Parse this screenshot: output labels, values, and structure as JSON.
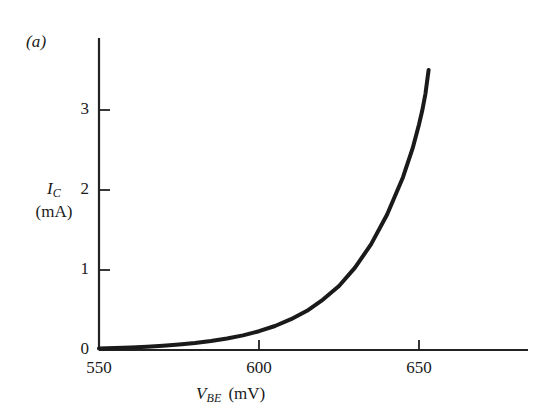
{
  "figure": {
    "panel_label": "(a)",
    "background_color": "#ffffff",
    "curve_color": "#1a1a1a",
    "axis_color": "#222222"
  },
  "axes": {
    "y": {
      "symbol": "I",
      "subscript": "C",
      "unit": "(mA)",
      "ticks": [
        {
          "value": 0,
          "label": "0"
        },
        {
          "value": 1,
          "label": "1"
        },
        {
          "value": 2,
          "label": "2"
        },
        {
          "value": 3,
          "label": "3"
        }
      ],
      "range": [
        0,
        3.9
      ]
    },
    "x": {
      "symbol": "V",
      "subscript": "BE",
      "unit": "(mV)",
      "ticks": [
        {
          "value": 550,
          "label": "550"
        },
        {
          "value": 600,
          "label": "600"
        },
        {
          "value": 650,
          "label": "650"
        }
      ],
      "range": [
        550,
        684
      ]
    }
  },
  "chart_data": {
    "type": "line",
    "title": "(a)",
    "xlabel": "V_BE (mV)",
    "ylabel": "I_C (mA)",
    "xlim": [
      550,
      684
    ],
    "ylim": [
      0,
      3.9
    ],
    "xticks": [
      550,
      600,
      650
    ],
    "yticks": [
      0,
      1,
      2,
      3
    ],
    "grid": false,
    "legend": null,
    "series": [
      {
        "name": "I_C vs V_BE",
        "color": "#1a1a1a",
        "line_width": 4,
        "x": [
          550,
          555,
          560,
          565,
          570,
          575,
          580,
          585,
          590,
          595,
          600,
          605,
          610,
          615,
          620,
          625,
          630,
          635,
          640,
          645,
          648,
          650,
          651,
          652,
          653
        ],
        "y": [
          0.02,
          0.025,
          0.032,
          0.041,
          0.053,
          0.068,
          0.087,
          0.112,
          0.143,
          0.183,
          0.235,
          0.3,
          0.385,
          0.49,
          0.63,
          0.8,
          1.03,
          1.32,
          1.69,
          2.16,
          2.52,
          2.82,
          2.99,
          3.2,
          3.5
        ]
      }
    ]
  }
}
